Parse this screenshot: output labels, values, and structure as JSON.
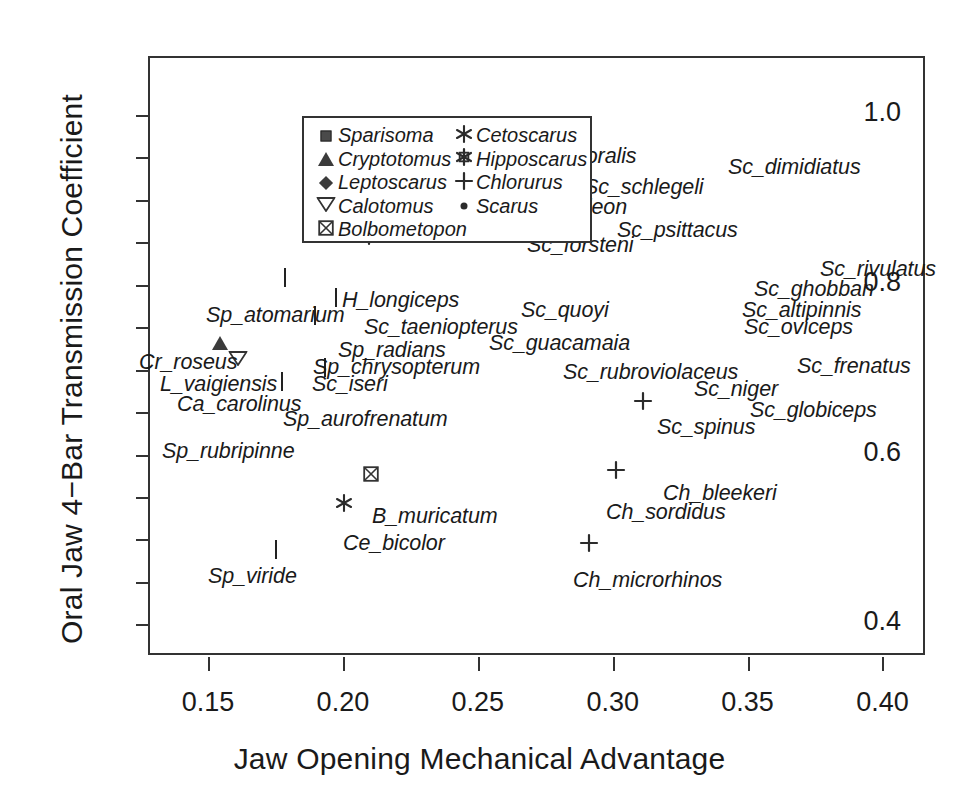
{
  "chart_data": {
    "type": "scatter",
    "title": "",
    "xlabel": "Jaw Opening Mechanical Advantage",
    "ylabel": "Oral Jaw 4−Bar Transmission Coefficient",
    "xlim": [
      0.1285,
      0.4165
    ],
    "ylim": [
      0.3615,
      1.067
    ],
    "xticks": [
      0.15,
      0.2,
      0.25,
      0.3,
      0.35,
      0.4
    ],
    "xticklabels": [
      "0.15",
      "0.20",
      "0.25",
      "0.30",
      "0.35",
      "0.40"
    ],
    "yticks": [
      0.4,
      0.6,
      0.8,
      1.0
    ],
    "yticklabels": [
      "0.4",
      "0.6",
      "0.8",
      "1.0"
    ],
    "grid": false,
    "legend_position": "top-left",
    "series": [
      {
        "name": "Sparisoma",
        "marker": "filled-square",
        "marker_key": "sparisoma"
      },
      {
        "name": "Cryptotomus",
        "marker": "filled-triangle-up",
        "marker_key": "cryptotomus"
      },
      {
        "name": "Leptoscarus",
        "marker": "filled-diamond",
        "marker_key": "leptoscarus"
      },
      {
        "name": "Calotomus",
        "marker": "open-triangle-down",
        "marker_key": "calotomus"
      },
      {
        "name": "Bolbometopon",
        "marker": "square-with-x",
        "marker_key": "bolbometopon"
      },
      {
        "name": "Cetoscarus",
        "marker": "asterisk",
        "marker_key": "cetoscarus"
      },
      {
        "name": "Hipposcarus",
        "marker": "star-burst",
        "marker_key": "hipposcarus"
      },
      {
        "name": "Chlorurus",
        "marker": "plus",
        "marker_key": "chlorurus"
      },
      {
        "name": "Scarus",
        "marker": "small-filled-circle",
        "marker_key": "scarus"
      }
    ],
    "points": [
      {
        "label": "Sc_flavipectoralis",
        "genus": "Scarus",
        "marker_key": "scarus",
        "x": 0.2698,
        "y": 1.009,
        "lx": 469,
        "ly": 142
      },
      {
        "label": "Sc_schlegeli",
        "genus": "Scarus",
        "marker_key": "scarus",
        "x": 0.3101,
        "y": 0.9679,
        "lx": 582,
        "ly": 173
      },
      {
        "label": "Sc_dimidiatus",
        "genus": "Scarus",
        "marker_key": "scarus",
        "x": 0.3597,
        "y": 0.9923,
        "lx": 726,
        "ly": 153
      },
      {
        "label": "Sc_chameleon",
        "genus": "Scarus",
        "marker_key": "scarus",
        "x": 0.2802,
        "y": 0.9513,
        "lx": 484,
        "ly": 193
      },
      {
        "label": "Sc_psittacus",
        "genus": "Scarus",
        "marker_key": "scarus",
        "x": 0.2795,
        "y": 0.9641,
        "lx": 615,
        "ly": 216
      },
      {
        "label": "Sc_forsteni",
        "genus": "Scarus",
        "marker_key": "scarus",
        "x": 0.2903,
        "y": 0.9397,
        "lx": 525,
        "ly": 231
      },
      {
        "label": "Sc_rivulatus",
        "genus": "Scarus",
        "marker_key": "scarus",
        "x": 0.3899,
        "y": 0.8641,
        "lx": 818,
        "ly": 255
      },
      {
        "label": "Sc_ghobban",
        "genus": "Scarus",
        "marker_key": "scarus",
        "x": 0.3701,
        "y": 0.8564,
        "lx": 752,
        "ly": 275
      },
      {
        "label": "H_longiceps",
        "genus": "Hipposcarus",
        "marker_key": "hipposcarus",
        "x": 0.2097,
        "y": 0.8551,
        "lx": 340,
        "ly": 286
      },
      {
        "label": "Sc_altipinnis",
        "genus": "Scarus",
        "marker_key": "scarus",
        "x": 0.3403,
        "y": 0.8269,
        "lx": 740,
        "ly": 296
      },
      {
        "label": "Sp_atomarium",
        "genus": "Sparisoma",
        "marker_key": "sparisoma",
        "x": 0.1785,
        "y": 0.8077,
        "lx": 204,
        "ly": 301
      },
      {
        "label": "Sc_taeniopterus",
        "genus": "Scarus",
        "marker_key": "scarus",
        "x": 0.21,
        "y": 0.83,
        "lx": 362,
        "ly": 313
      },
      {
        "label": "Sc_quoyi",
        "genus": "Scarus",
        "marker_key": "scarus",
        "x": 0.2795,
        "y": 0.8103,
        "lx": 519,
        "ly": 296
      },
      {
        "label": "Sc_oviceps",
        "genus": "Scarus",
        "marker_key": "scarus",
        "x": 0.3406,
        "y": 0.8077,
        "lx": 742,
        "ly": 313
      },
      {
        "label": "Sp_radians",
        "genus": "Sparisoma",
        "marker_key": "sparisoma",
        "x": 0.1976,
        "y": 0.7846,
        "lx": 336,
        "ly": 336
      },
      {
        "label": "Cr_roseus",
        "genus": "Cryptotomus",
        "marker_key": "cryptotomus",
        "x": 0.1545,
        "y": 0.7487,
        "lx": 137,
        "ly": 348
      },
      {
        "label": "Sc_guacamaia",
        "genus": "Scarus",
        "marker_key": "scarus",
        "x": 0.2767,
        "y": 0.7679,
        "lx": 487,
        "ly": 329
      },
      {
        "label": "Sp_chrysopterum",
        "genus": "Sparisoma",
        "marker_key": "sparisoma",
        "x": 0.1896,
        "y": 0.7628,
        "lx": 311,
        "ly": 353
      },
      {
        "label": "Sc_frenatus",
        "genus": "Scarus",
        "marker_key": "scarus",
        "x": 0.3795,
        "y": 0.7449,
        "lx": 795,
        "ly": 352
      },
      {
        "label": "L_vaigiensis",
        "genus": "Leptoscarus",
        "marker_key": "leptoscarus",
        "x": 0.1767,
        "y": 0.7487,
        "lx": 158,
        "ly": 370
      },
      {
        "label": "Sc_iseri",
        "genus": "Scarus",
        "marker_key": "scarus",
        "x": 0.1885,
        "y": 0.7423,
        "lx": 310,
        "ly": 370
      },
      {
        "label": "Sc_rubroviolaceus",
        "genus": "Scarus",
        "marker_key": "scarus",
        "x": 0.3111,
        "y": 0.7397,
        "lx": 561,
        "ly": 358
      },
      {
        "label": "Sc_niger",
        "genus": "Scarus",
        "marker_key": "scarus",
        "x": 0.3413,
        "y": 0.7192,
        "lx": 692,
        "ly": 375
      },
      {
        "label": "Ca_carolinus",
        "genus": "Calotomus",
        "marker_key": "calotomus",
        "x": 0.161,
        "y": 0.7115,
        "lx": 175,
        "ly": 390
      },
      {
        "label": "Sc_globiceps",
        "genus": "Scarus",
        "marker_key": "scarus",
        "x": 0.3413,
        "y": 0.7038,
        "lx": 748,
        "ly": 396
      },
      {
        "label": "Sp_aurofrenatum",
        "genus": "Sparisoma",
        "marker_key": "sparisoma",
        "x": 0.1932,
        "y": 0.7013,
        "lx": 281,
        "ly": 405
      },
      {
        "label": "Sc_spinus",
        "genus": "Scarus",
        "marker_key": "scarus",
        "x": 0.3392,
        "y": 0.7,
        "lx": 655,
        "ly": 413
      },
      {
        "label": "Sp_rubripinne",
        "genus": "Sparisoma",
        "marker_key": "sparisoma",
        "x": 0.1774,
        "y": 0.6859,
        "lx": 160,
        "ly": 437
      },
      {
        "label": "Ch_bleekeri",
        "genus": "Chlorurus",
        "marker_key": "chlorurus",
        "x": 0.3111,
        "y": 0.6603,
        "lx": 661,
        "ly": 479
      },
      {
        "label": "Ch_sordidus",
        "genus": "Chlorurus",
        "marker_key": "chlorurus",
        "x": 0.3014,
        "y": 0.5795,
        "lx": 604,
        "ly": 498
      },
      {
        "label": "B_muricatum",
        "genus": "Bolbometopon",
        "marker_key": "bolbometopon",
        "x": 0.2104,
        "y": 0.5744,
        "lx": 370,
        "ly": 502
      },
      {
        "label": "Ce_bicolor",
        "genus": "Cetoscarus",
        "marker_key": "cetoscarus",
        "x": 0.2003,
        "y": 0.541,
        "lx": 341,
        "ly": 529
      },
      {
        "label": "Sp_viride",
        "genus": "Sparisoma",
        "marker_key": "sparisoma",
        "x": 0.1753,
        "y": 0.4872,
        "lx": 206,
        "ly": 562
      },
      {
        "label": "Ch_microrhinos",
        "genus": "Chlorurus",
        "marker_key": "chlorurus",
        "x": 0.2913,
        "y": 0.4936,
        "lx": 571,
        "ly": 566
      }
    ]
  },
  "legend": {
    "column_1": [
      {
        "label": "Sparisoma",
        "marker_key": "sparisoma"
      },
      {
        "label": "Cryptotomus",
        "marker_key": "cryptotomus"
      },
      {
        "label": "Leptoscarus",
        "marker_key": "leptoscarus"
      },
      {
        "label": "Calotomus",
        "marker_key": "calotomus"
      },
      {
        "label": "Bolbometopon",
        "marker_key": "bolbometopon"
      }
    ],
    "column_2": [
      {
        "label": "Cetoscarus",
        "marker_key": "cetoscarus"
      },
      {
        "label": "Hipposcarus",
        "marker_key": "hipposcarus"
      },
      {
        "label": "Chlorurus",
        "marker_key": "chlorurus"
      },
      {
        "label": "Scarus",
        "marker_key": "scarus"
      }
    ]
  },
  "colors": {
    "marker": "#2b2b2b",
    "axis": "#333333",
    "text": "#1a1a1a",
    "background": "#ffffff"
  }
}
